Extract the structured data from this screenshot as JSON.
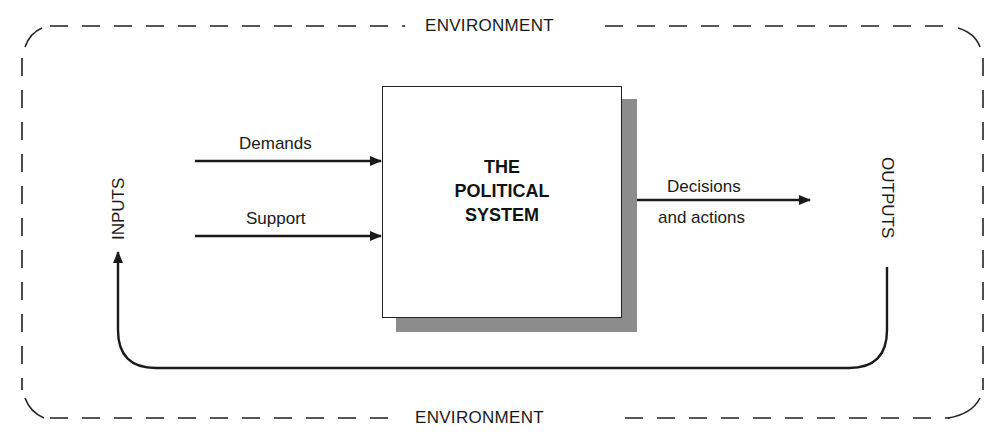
{
  "environment": {
    "top_label": "ENVIRONMENT",
    "bottom_label": "ENVIRONMENT",
    "border_style": "dashed",
    "border_color": "#222222"
  },
  "system": {
    "title_lines": [
      "THE",
      "POLITICAL",
      "SYSTEM"
    ],
    "shadow_color": "#8c8c8c",
    "border_color": "#222222"
  },
  "inputs": {
    "label": "INPUTS",
    "arrows": [
      {
        "label": "Demands"
      },
      {
        "label": "Support"
      }
    ]
  },
  "outputs": {
    "label": "OUTPUTS",
    "arrow": {
      "label_line1": "Decisions",
      "label_line2": "and actions"
    }
  },
  "feedback": {
    "direction": "outputs-to-inputs",
    "line_color": "#1a1a1a"
  }
}
